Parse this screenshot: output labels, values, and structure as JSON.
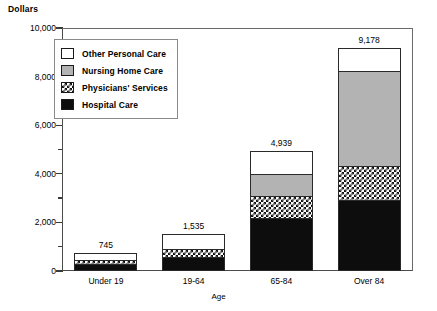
{
  "chart_data": {
    "type": "bar",
    "subtype": "stacked-vertical",
    "title": "",
    "xlabel": "Age",
    "ylabel": "Dollars",
    "ylim": [
      0,
      10000
    ],
    "ytick_step": 2000,
    "yminor_step": 1000,
    "grid": false,
    "legend_position": "upper-left-inside",
    "categories": [
      "Under 19",
      "19-64",
      "65-84",
      "Over 84"
    ],
    "totals": [
      745,
      1535,
      4939,
      9178
    ],
    "total_labels": [
      "745",
      "1,535",
      "4,939",
      "9,178"
    ],
    "series": [
      {
        "name": "Other Personal Care",
        "fill": "solid-white",
        "color": "#ffffff",
        "values": [
          300,
          630,
          905,
          905
        ]
      },
      {
        "name": "Nursing Home Care",
        "fill": "solid-gray",
        "color": "#b3b3b3",
        "values": [
          0,
          0,
          950,
          3950
        ]
      },
      {
        "name": "Physicians' Services",
        "fill": "checkerboard",
        "color": "#ffffff",
        "values": [
          145,
          330,
          905,
          1400
        ]
      },
      {
        "name": "Hospital Care",
        "fill": "solid-black",
        "color": "#0d0d0d",
        "values": [
          300,
          575,
          2179,
          2923
        ]
      }
    ],
    "ytick_labels": [
      "0",
      "2,000",
      "4,000",
      "6,000",
      "8,000",
      "10,000"
    ],
    "ytick_values": [
      0,
      2000,
      4000,
      6000,
      8000,
      10000
    ]
  },
  "axis": {
    "y_title": "Dollars",
    "x_title": "Age"
  },
  "legend": {
    "items": [
      {
        "label": "Other Personal Care"
      },
      {
        "label": "Nursing Home Care"
      },
      {
        "label": "Physicians' Services"
      },
      {
        "label": "Hospital Care"
      }
    ]
  }
}
